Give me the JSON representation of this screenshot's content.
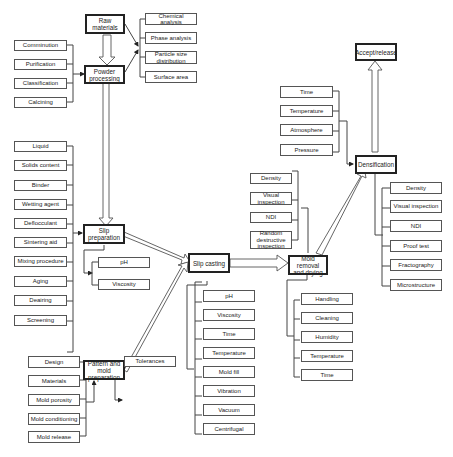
{
  "diagram": {
    "type": "flowchart"
  },
  "main_steps": {
    "raw_materials": "Raw materials",
    "powder_processing": "Powder processing",
    "slip_preparation": "Slip preparation",
    "pattern_mold": "Pattern and mold preparation",
    "slip_casting": "Slip casting",
    "mold_removal": "Mold removal and drying",
    "densification": "Densification",
    "accept_release": "Accept/release"
  },
  "raw_materials_checks": [
    "Chemical analysis",
    "Phase analysis",
    "Particle size distribution",
    "Surface area"
  ],
  "powder_processing_inputs": [
    "Comminution",
    "Purification",
    "Classification",
    "Calcining"
  ],
  "slip_preparation_inputs": [
    "Liquid",
    "Solids content",
    "Binder",
    "Wetting agent",
    "Deflocculant",
    "Sintering aid",
    "Mixing procedure",
    "Aging",
    "Deairing",
    "Screening"
  ],
  "slip_preparation_outputs": [
    "pH",
    "Viscosity"
  ],
  "pattern_mold_inputs": [
    "Design",
    "Materials",
    "Mold porosity",
    "Mold conditioning",
    "Mold release"
  ],
  "pattern_mold_outputs": [
    "Tolerances"
  ],
  "slip_casting_params": [
    "pH",
    "Viscosity",
    "Time",
    "Temperature",
    "Mold fill",
    "Vibration",
    "Vacuum",
    "Centrifugal"
  ],
  "mold_removal_checks": [
    "Density",
    "Visual inspection",
    "NDI",
    "Random destructive inspection"
  ],
  "mold_removal_params": [
    "Handling",
    "Cleaning",
    "Humidity",
    "Temperature",
    "Time"
  ],
  "densification_params": [
    "Time",
    "Temperature",
    "Atmosphere",
    "Pressure"
  ],
  "densification_checks": [
    "Density",
    "Visual inspection",
    "NDI",
    "Proof test",
    "Fractography",
    "Microstructure"
  ]
}
